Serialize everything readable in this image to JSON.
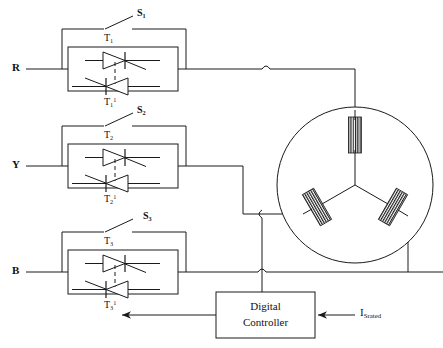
{
  "diagram": {
    "stroke_color": "#1a1a1a",
    "background": "#ffffff"
  },
  "phases": [
    {
      "terminal": "R",
      "switch": "S",
      "switch_index": "1",
      "thyristor_forward": "T",
      "thyristor_forward_index": "1",
      "thyristor_reverse": "T",
      "thyristor_reverse_index": "1",
      "thyristor_reverse_sup": "1"
    },
    {
      "terminal": "Y",
      "switch": "S",
      "switch_index": "2",
      "thyristor_forward": "T",
      "thyristor_forward_index": "2",
      "thyristor_reverse": "T",
      "thyristor_reverse_index": "2",
      "thyristor_reverse_sup": "1"
    },
    {
      "terminal": "B",
      "switch": "S",
      "switch_index": "3",
      "thyristor_forward": "T",
      "thyristor_forward_index": "3",
      "thyristor_reverse": "T",
      "thyristor_reverse_index": "3",
      "thyristor_reverse_sup": "1"
    }
  ],
  "labels": {
    "phase_r": "R",
    "phase_y": "Y",
    "phase_b": "B",
    "s1": "S",
    "s1_sub": "1",
    "s2": "S",
    "s2_sub": "2",
    "s3": "S",
    "s3_sub": "3",
    "t1": "T",
    "t1_sub": "1",
    "t1p": "T",
    "t1p_sub": "1",
    "t1p_sup": "1",
    "t2": "T",
    "t2_sub": "2",
    "t2p": "T",
    "t2p_sub": "2",
    "t2p_sup": "1",
    "t3": "T",
    "t3_sub": "3",
    "t3p": "T",
    "t3p_sub": "3",
    "t3p_sup": "1",
    "current_signal": "I",
    "current_signal_sub": "Srated"
  },
  "controller": {
    "line1": "Digital",
    "line2": "Controller"
  },
  "motor": {
    "type": "three-phase-induction-motor",
    "connection": "star",
    "winding_count": 3
  }
}
